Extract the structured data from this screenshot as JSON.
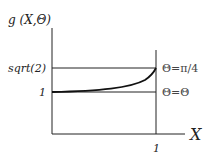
{
  "diagram": {
    "y_axis_label": "g (X,Θ)",
    "x_axis_label": "X",
    "y_ticks": [
      {
        "label": "sqrt(2)",
        "value": 1.4142
      },
      {
        "label": "1",
        "value": 1
      }
    ],
    "x_ticks": [
      {
        "label": "1",
        "value": 1
      }
    ],
    "curve_labels": {
      "upper": "Θ=π/4",
      "lower": "Θ=Θ"
    },
    "colors": {
      "line": "#222222",
      "curve": "#111111"
    }
  }
}
